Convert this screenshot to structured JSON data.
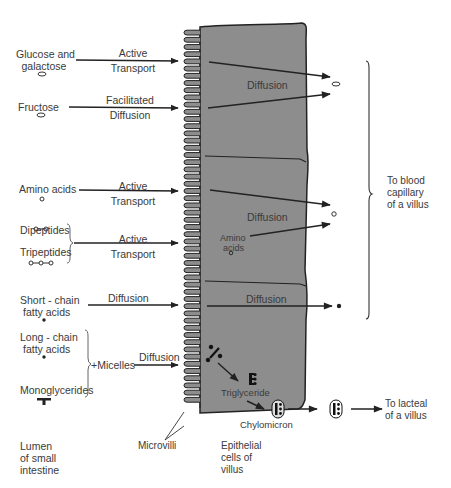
{
  "diagram": {
    "type": "absorption-of-nutrients-small-intestine",
    "colors": {
      "cell_fill": "#8d8d8d",
      "line": "#222222",
      "text": "#3a3a3a"
    },
    "nutrients": [
      {
        "id": "glucose",
        "label_line1": "Glucose and",
        "label_line2": "galactose",
        "symbol": "oval",
        "mechanism_line1": "Active",
        "mechanism_line2": "Transport"
      },
      {
        "id": "fructose",
        "label_line1": "Fructose",
        "symbol": "oval",
        "mechanism_line1": "Facilitated",
        "mechanism_line2": "Diffusion"
      },
      {
        "id": "amino-acids",
        "label_line1": "Amino  acids",
        "symbol": "circle",
        "mechanism_line1": "Active",
        "mechanism_line2": "Transport"
      },
      {
        "id": "peptides",
        "label_dipeptides": "Dipeptides",
        "label_tripeptides": "Tripeptides",
        "symbol": "chain",
        "mechanism_line1": "Active",
        "mechanism_line2": "Transport"
      },
      {
        "id": "short-chain",
        "label_line1": "Short - chain",
        "label_line2": "fatty acids",
        "symbol": "dot",
        "mechanism_line1": "Diffusion"
      },
      {
        "id": "long-chain",
        "label_line1": "Long - chain",
        "label_line2": "fatty acids",
        "symbol": "dot"
      },
      {
        "id": "monoglycerides",
        "label_line1": "Monoglycerides",
        "symbol": "t-bar"
      }
    ],
    "micelles": {
      "label": "+Micelles",
      "mechanism": "Diffusion"
    },
    "cell_labels": {
      "diffusion_1": "Diffusion",
      "diffusion_2": "Diffusion",
      "diffusion_3": "Diffusion",
      "amino_in_cell_line1": "Amino",
      "amino_in_cell_line2": "acids",
      "triglyceride": "Triglyceride",
      "chylomicron": "Chylomicron"
    },
    "destinations": {
      "blood_line1": "To blood",
      "blood_line2": "capillary",
      "blood_line3": "of a villus",
      "lacteal_line1": "To lacteal",
      "lacteal_line2": "of a villus"
    },
    "bottom_labels": {
      "lumen_line1": "Lumen",
      "lumen_line2": "of  small",
      "lumen_line3": "intestine",
      "microvilli": "Microvilli",
      "epithelial_line1": "Epithelial",
      "epithelial_line2": "cells of",
      "epithelial_line3": "villus"
    }
  }
}
